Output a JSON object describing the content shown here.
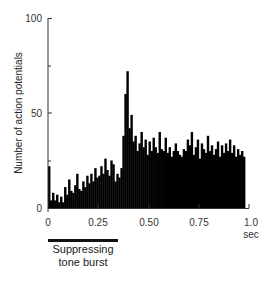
{
  "chart_data": {
    "type": "bar",
    "title": "",
    "xlabel": "sec",
    "ylabel": "Number of action potentials",
    "xlim": [
      0,
      1.0
    ],
    "ylim": [
      0,
      100
    ],
    "x_ticks": [
      "0",
      "0.25",
      "0.50",
      "0.75",
      "1.0"
    ],
    "y_ticks": [
      "0",
      "50",
      "100"
    ],
    "y_minor_ticks": [
      25,
      75
    ],
    "grid": false,
    "legend": null,
    "bin_width": 0.01,
    "x": [
      0.0,
      0.01,
      0.02,
      0.03,
      0.04,
      0.05,
      0.06,
      0.07,
      0.08,
      0.09,
      0.1,
      0.11,
      0.12,
      0.13,
      0.14,
      0.15,
      0.16,
      0.17,
      0.18,
      0.19,
      0.2,
      0.21,
      0.22,
      0.23,
      0.24,
      0.25,
      0.26,
      0.27,
      0.28,
      0.29,
      0.3,
      0.31,
      0.32,
      0.33,
      0.34,
      0.35,
      0.36,
      0.37,
      0.38,
      0.39,
      0.4,
      0.41,
      0.42,
      0.43,
      0.44,
      0.45,
      0.46,
      0.47,
      0.48,
      0.49,
      0.5,
      0.51,
      0.52,
      0.53,
      0.54,
      0.55,
      0.56,
      0.57,
      0.58,
      0.59,
      0.6,
      0.61,
      0.62,
      0.63,
      0.64,
      0.65,
      0.66,
      0.67,
      0.68,
      0.69,
      0.7,
      0.71,
      0.72,
      0.73,
      0.74,
      0.75,
      0.76,
      0.77,
      0.78,
      0.79,
      0.8,
      0.81,
      0.82,
      0.83,
      0.84,
      0.85,
      0.86,
      0.87,
      0.88,
      0.89,
      0.9,
      0.91,
      0.92,
      0.93,
      0.94,
      0.95,
      0.96,
      0.97
    ],
    "values": [
      22,
      4,
      8,
      4,
      7,
      3,
      6,
      3,
      11,
      7,
      15,
      9,
      8,
      12,
      18,
      10,
      9,
      14,
      11,
      17,
      13,
      18,
      14,
      21,
      16,
      17,
      22,
      18,
      26,
      20,
      17,
      25,
      23,
      14,
      18,
      16,
      21,
      38,
      60,
      72,
      42,
      49,
      35,
      38,
      30,
      34,
      40,
      32,
      36,
      28,
      35,
      30,
      37,
      32,
      29,
      40,
      31,
      30,
      37,
      29,
      32,
      27,
      30,
      34,
      30,
      28,
      27,
      31,
      30,
      36,
      33,
      40,
      28,
      32,
      36,
      26,
      34,
      31,
      29,
      38,
      30,
      33,
      28,
      31,
      35,
      27,
      33,
      29,
      34,
      30,
      36,
      29,
      33,
      27,
      31,
      28,
      30,
      27
    ],
    "annotation": {
      "stimulus_label": "Suppressing tone burst",
      "stimulus_start": 0.0,
      "stimulus_end": 0.35
    }
  },
  "labels": {
    "ylabel": "Number of action potentials",
    "xunit": "sec",
    "y_tick_0": "0",
    "y_tick_50": "50",
    "y_tick_100": "100",
    "x_tick_0": "0",
    "x_tick_025": "0.25",
    "x_tick_050": "0.50",
    "x_tick_075": "0.75",
    "x_tick_100": "1.0",
    "stimulus_line1": "Suppressing",
    "stimulus_line2": "tone burst"
  }
}
